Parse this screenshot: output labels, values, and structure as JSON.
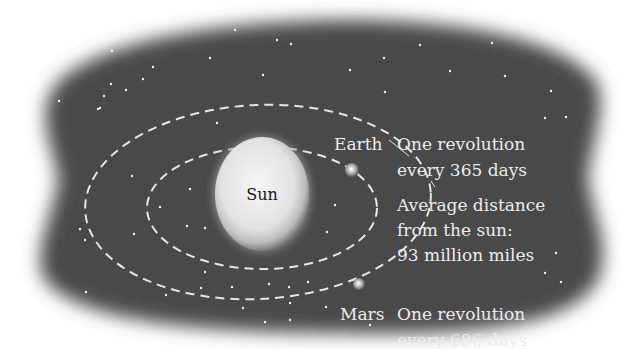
{
  "diagram": {
    "colors": {
      "space": "#4a4a4a",
      "orbit": "#e6e6e6",
      "star": "#f0f0f0",
      "text": "#ececec",
      "sun_text": "#1a1a1a"
    },
    "sun": {
      "label": "Sun"
    },
    "earth": {
      "label": "Earth",
      "info_line1": "One revolution",
      "info_line2": "every 365 days"
    },
    "distance": {
      "line1": "Average distance",
      "line2": "from the sun:",
      "line3": "93 million miles"
    },
    "mars": {
      "label": "Mars",
      "info_line1": "One revolution",
      "info_line2": "every 686 days"
    }
  }
}
